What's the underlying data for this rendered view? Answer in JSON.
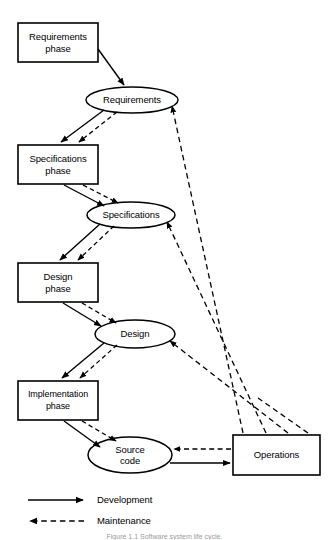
{
  "figure": {
    "caption": "Figure 1.1  Software system life cycle.",
    "background_color": "#ffffff",
    "line_color": "#000000"
  },
  "phases": [
    {
      "id": "requirements-phase",
      "label": "Requirements\nphase"
    },
    {
      "id": "specifications-phase",
      "label": "Specifications\nphase"
    },
    {
      "id": "design-phase",
      "label": "Design\nphase"
    },
    {
      "id": "implementation-phase",
      "label": "Implementation\nphase"
    }
  ],
  "artifacts": [
    {
      "id": "requirements-artifact",
      "label": "Requirements"
    },
    {
      "id": "specifications-artifact",
      "label": "Specifications"
    },
    {
      "id": "design-artifact",
      "label": "Design"
    },
    {
      "id": "source-code-artifact",
      "label": "Source\ncode"
    }
  ],
  "operations": {
    "id": "operations",
    "label": "Operations"
  },
  "legend": {
    "items": [
      {
        "id": "legend-development",
        "label": "Development",
        "style": "solid"
      },
      {
        "id": "legend-maintenance",
        "label": "Maintenance",
        "style": "dashed"
      }
    ]
  }
}
